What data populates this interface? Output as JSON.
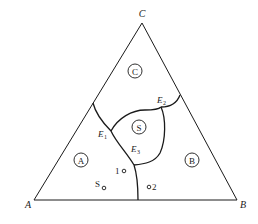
{
  "diagram": {
    "type": "ternary-phase-diagram",
    "vertices": [
      {
        "id": "A",
        "label": "A",
        "x": 34,
        "y": 200
      },
      {
        "id": "B",
        "label": "B",
        "x": 237,
        "y": 200
      },
      {
        "id": "C",
        "label": "C",
        "x": 142,
        "y": 23
      }
    ],
    "regions": [
      {
        "id": "A",
        "label": "A",
        "x": 81,
        "y": 160
      },
      {
        "id": "B",
        "label": "B",
        "x": 192,
        "y": 160
      },
      {
        "id": "C",
        "label": "C",
        "x": 135,
        "y": 71
      },
      {
        "id": "S",
        "label": "S",
        "x": 139,
        "y": 127
      }
    ],
    "eutectic_points": [
      {
        "label": "E",
        "sub": "1",
        "x": 101,
        "y": 136
      },
      {
        "label": "E",
        "sub": "2",
        "x": 161,
        "y": 103
      },
      {
        "label": "E",
        "sub": "3",
        "x": 132,
        "y": 153
      }
    ],
    "points": [
      {
        "label": "1",
        "x": 124,
        "y": 171,
        "label_pos": "left"
      },
      {
        "label": "S",
        "x": 104,
        "y": 187,
        "label_pos": "left"
      },
      {
        "label": "2",
        "x": 149,
        "y": 187,
        "label_pos": "right"
      }
    ],
    "colors": {
      "line": "#1a1a1a",
      "text": "#222222",
      "background": "#ffffff"
    }
  }
}
